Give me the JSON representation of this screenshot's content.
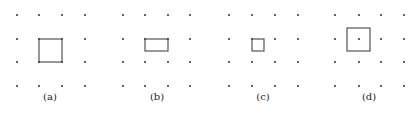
{
  "panels": [
    {
      "label": "(a)",
      "label_x": 50,
      "grid": {
        "xs": [
          17,
          39,
          62,
          85
        ],
        "ys": [
          15,
          39,
          62,
          86
        ]
      },
      "shape": {
        "type": "square",
        "x": 39,
        "y": 39,
        "w": 23,
        "h": 23,
        "description": "unit square with corners on four grid dots"
      }
    },
    {
      "label": "(b)",
      "label_x": 157,
      "grid": {
        "xs": [
          123,
          145,
          168,
          190
        ],
        "ys": [
          15,
          39,
          62,
          86
        ]
      },
      "shape": {
        "type": "rectangle",
        "x": 145,
        "y": 39,
        "w": 23,
        "h": 12,
        "description": "half-height rectangle hanging from top edge between two dots"
      }
    },
    {
      "label": "(c)",
      "label_x": 263,
      "grid": {
        "xs": [
          229,
          252,
          275,
          298
        ],
        "ys": [
          15,
          39,
          62,
          86
        ]
      },
      "shape": {
        "type": "square",
        "x": 252,
        "y": 39,
        "w": 12,
        "h": 12,
        "description": "quarter-size square anchored at one dot"
      }
    },
    {
      "label": "(d)",
      "label_x": 369,
      "grid": {
        "xs": [
          335,
          359,
          381,
          404
        ],
        "ys": [
          15,
          39,
          62,
          86
        ]
      },
      "shape": {
        "type": "square",
        "x": 347,
        "y": 28,
        "w": 23,
        "h": 23,
        "description": "unit square centered on a grid dot"
      }
    }
  ],
  "colors": {
    "dot": "#333333",
    "stroke": "#444444",
    "background": "#ffffff"
  }
}
